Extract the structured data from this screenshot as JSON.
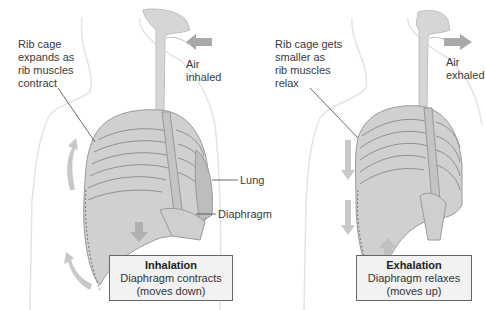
{
  "inhalation": {
    "rib_label": "Rib cage\nexpands as\nrib muscles\ncontract",
    "air_label": "Air\ninhaled",
    "lung_label": "Lung",
    "diaphragm_label": "Diaphragm",
    "box_title": "Inhalation",
    "box_line1": "Diaphragm contracts",
    "box_line2": "(moves down)"
  },
  "exhalation": {
    "rib_label": "Rib cage gets\nsmaller as\nrib muscles\nrelax",
    "air_label": "Air\nexhaled",
    "box_title": "Exhalation",
    "box_line1": "Diaphragm relaxes",
    "box_line2": "(moves up)"
  },
  "colors": {
    "body_outline": "#e0e0e0",
    "airway": "#d6d6d6",
    "rib": "#c8c8c8",
    "lung": "#bdbdbd",
    "arrow": "#a9a9a9"
  }
}
